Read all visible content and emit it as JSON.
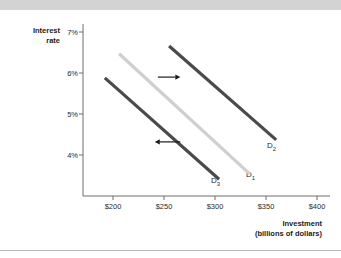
{
  "figure": {
    "background_color": "#ffffff",
    "top_band_color": "#d3d3d3",
    "bottom_rule_color": "#b8b8b8"
  },
  "axes": {
    "y_title_line1": "Interest",
    "y_title_line2": "rate",
    "x_title_line1": "Investment",
    "x_title_line2": "(billions of dollars)",
    "axis_color": "#6e6e6e"
  },
  "chart_data": {
    "type": "line",
    "title": "",
    "subtitle": "",
    "xlabel": "Investment (billions of dollars)",
    "ylabel": "Interest rate",
    "xlim": [
      170,
      420
    ],
    "ylim": [
      3.0,
      7.4
    ],
    "grid": false,
    "legend": "none",
    "x_ticks": [
      200,
      250,
      300,
      350,
      400
    ],
    "x_tick_labels": [
      "$200",
      "$250",
      "$300",
      "$350",
      "$400"
    ],
    "y_ticks": [
      4,
      5,
      6,
      7
    ],
    "y_tick_labels": [
      "4%",
      "5%",
      "6%",
      "7%"
    ],
    "series": [
      {
        "name": "D1",
        "label": "D",
        "label_sub": "1",
        "color": "#cfcfcf",
        "linewidth": 3.2,
        "points": [
          {
            "x": 206,
            "y": 6.47
          },
          {
            "x": 334,
            "y": 3.54
          }
        ]
      },
      {
        "name": "D2",
        "label": "D",
        "label_sub": "2",
        "color": "#4a4a4a",
        "linewidth": 3.2,
        "points": [
          {
            "x": 255,
            "y": 6.66
          },
          {
            "x": 360,
            "y": 4.37
          }
        ]
      },
      {
        "name": "D3",
        "label": "D",
        "label_sub": "3",
        "color": "#4a4a4a",
        "linewidth": 3.2,
        "points": [
          {
            "x": 192,
            "y": 5.88
          },
          {
            "x": 304,
            "y": 3.41
          }
        ]
      }
    ],
    "annotations": [
      {
        "name": "rightward-shift-arrow",
        "direction": "right",
        "x_start": 244,
        "x_end": 266,
        "y": 5.9,
        "color": "#1a1a1a"
      },
      {
        "name": "leftward-shift-arrow",
        "direction": "left",
        "x_start": 266,
        "x_end": 241,
        "y": 4.32,
        "color": "#1a1a1a"
      }
    ]
  }
}
